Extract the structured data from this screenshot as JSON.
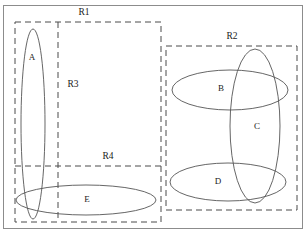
{
  "diagram": {
    "type": "venn-region-diagram",
    "outer_frame": {
      "name": "outer-border",
      "x": 3,
      "y": 5,
      "width": 300,
      "height": 224,
      "stroke": "#8c8c8c"
    },
    "colors": {
      "region_stroke": "#4a4a4a",
      "ellipse_stroke": "#555555",
      "frame_stroke": "#8c8c8c",
      "text": "#1a1a1a",
      "background": "#ffffff"
    },
    "regions": [
      {
        "id": "R1",
        "label": "R1",
        "label_x": 84,
        "label_y": 13,
        "x": 15,
        "y": 22,
        "width": 146,
        "height": 200,
        "style": "dashed"
      },
      {
        "id": "R2",
        "label": "R2",
        "label_x": 232,
        "label_y": 37,
        "x": 166,
        "y": 46,
        "width": 131,
        "height": 164,
        "style": "dashed"
      },
      {
        "id": "R3",
        "label": "R3",
        "label_x": 73,
        "label_y": 85,
        "divider": "vertical",
        "divider_x": 58,
        "divider_y1": 22,
        "divider_y2": 222,
        "style": "dashed"
      },
      {
        "id": "R4",
        "label": "R4",
        "label_x": 108,
        "label_y": 157,
        "divider": "horizontal",
        "divider_y": 166,
        "divider_x1": 15,
        "divider_x2": 161,
        "style": "dashed"
      }
    ],
    "sets": [
      {
        "id": "A",
        "label": "A",
        "label_x": 32,
        "label_y": 58,
        "cx": 33,
        "cy": 124,
        "rx": 12,
        "ry": 95,
        "rotate": 0,
        "orientation": "vertical-tall"
      },
      {
        "id": "B",
        "label": "B",
        "label_x": 221,
        "label_y": 89,
        "cx": 230,
        "cy": 90,
        "rx": 58,
        "ry": 20,
        "rotate": 0,
        "orientation": "horizontal-wide"
      },
      {
        "id": "C",
        "label": "C",
        "label_x": 257,
        "label_y": 127,
        "cx": 255,
        "cy": 126,
        "rx": 25,
        "ry": 77,
        "rotate": 0,
        "orientation": "vertical-tall"
      },
      {
        "id": "D",
        "label": "D",
        "label_x": 218,
        "label_y": 182,
        "cx": 228,
        "cy": 182,
        "rx": 58,
        "ry": 19,
        "rotate": 0,
        "orientation": "horizontal-wide"
      },
      {
        "id": "E",
        "label": "E",
        "label_x": 87,
        "label_y": 200,
        "cx": 86,
        "cy": 200,
        "rx": 70,
        "ry": 15,
        "rotate": 0,
        "orientation": "horizontal-wide"
      }
    ]
  }
}
